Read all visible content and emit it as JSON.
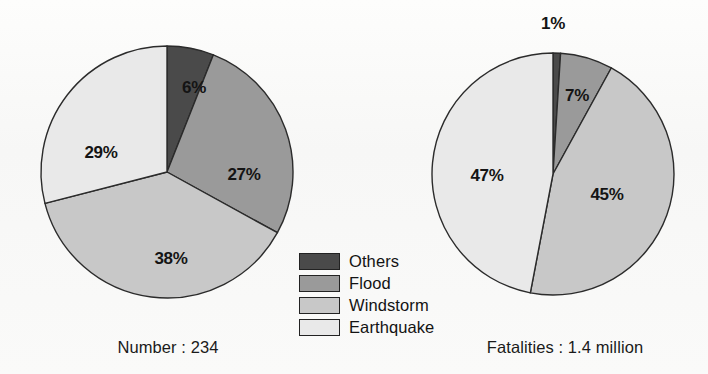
{
  "background_color": "#fbfbfa",
  "legend": {
    "items": [
      {
        "label": "Others",
        "color": "#4a4a4a"
      },
      {
        "label": "Flood",
        "color": "#9a9a9a"
      },
      {
        "label": "Windstorm",
        "color": "#c8c8c8"
      },
      {
        "label": "Earthquake",
        "color": "#e9e9e9"
      }
    ]
  },
  "left_chart": {
    "caption": "Number : 234",
    "labels": {
      "others": "6%",
      "flood": "27%",
      "windstorm": "38%",
      "earthquake": "29%"
    }
  },
  "right_chart": {
    "caption": "Fatalities : 1.4 million",
    "labels": {
      "others": "1%",
      "flood": "7%",
      "windstorm": "45%",
      "earthquake": "47%"
    }
  },
  "chart_data": [
    {
      "type": "pie",
      "title": "Number : 234",
      "categories": [
        "Others",
        "Flood",
        "Windstorm",
        "Earthquake"
      ],
      "values": [
        6,
        27,
        38,
        29
      ],
      "value_labels": [
        "6%",
        "27%",
        "38%",
        "29%"
      ],
      "units": "percent",
      "total_label": "Number : 234",
      "total_value": 234,
      "colors": [
        "#4a4a4a",
        "#9a9a9a",
        "#c8c8c8",
        "#e9e9e9"
      ],
      "start_angle_deg": 0,
      "direction": "clockwise",
      "legend_position": "center-bottom",
      "legend": [
        "Others",
        "Flood",
        "Windstorm",
        "Earthquake"
      ]
    },
    {
      "type": "pie",
      "title": "Fatalities : 1.4 million",
      "categories": [
        "Others",
        "Flood",
        "Windstorm",
        "Earthquake"
      ],
      "values": [
        1,
        7,
        45,
        47
      ],
      "value_labels": [
        "1%",
        "7%",
        "45%",
        "47%"
      ],
      "units": "percent",
      "total_label": "Fatalities : 1.4 million",
      "total_value": 1400000,
      "colors": [
        "#4a4a4a",
        "#9a9a9a",
        "#c8c8c8",
        "#e9e9e9"
      ],
      "start_angle_deg": 0,
      "direction": "clockwise",
      "legend_position": "center-bottom",
      "legend": [
        "Others",
        "Flood",
        "Windstorm",
        "Earthquake"
      ]
    }
  ]
}
